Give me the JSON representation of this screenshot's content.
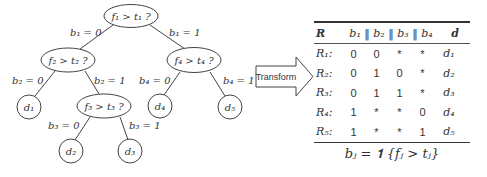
{
  "tree": {
    "nodes": {
      "root": {
        "label": "f₁ > t₁ ?"
      },
      "f2": {
        "label": "f₂ > t₂ ?"
      },
      "f3": {
        "label": "f₃ > t₃ ?"
      },
      "f4": {
        "label": "f₄ > t₄ ?"
      },
      "d1": {
        "label": "d₁"
      },
      "d2": {
        "label": "d₂"
      },
      "d3": {
        "label": "d₃"
      },
      "d4": {
        "label": "d₄"
      },
      "d5": {
        "label": "d₅"
      }
    },
    "edges": {
      "root_f2": "b₁ = 0",
      "root_f4": "b₁ = 1",
      "f2_d1": "b₂ = 0",
      "f2_f3": "b₂ = 1",
      "f3_d2": "b₃ = 0",
      "f3_d3": "b₃ = 1",
      "f4_d4": "b₄ = 0",
      "f4_d5": "b₄ = 1"
    }
  },
  "arrow": {
    "label": "Transform"
  },
  "table": {
    "headers": {
      "rule": "R",
      "bits": "b₁ ‖ b₂ ‖ b₃ ‖ b₄",
      "leaf": "d"
    },
    "rows": [
      {
        "rule": "R₁:",
        "b1": "0",
        "b2": "0",
        "b3": "*",
        "b4": "*",
        "d": "d₁"
      },
      {
        "rule": "R₂:",
        "b1": "0",
        "b2": "1",
        "b3": "0",
        "b4": "*",
        "d": "d₂"
      },
      {
        "rule": "R₃:",
        "b1": "0",
        "b2": "1",
        "b3": "1",
        "b4": "*",
        "d": "d₃"
      },
      {
        "rule": "R₄:",
        "b1": "1",
        "b2": "*",
        "b3": "*",
        "b4": "0",
        "d": "d₄"
      },
      {
        "rule": "R₅:",
        "b1": "1",
        "b2": "*",
        "b3": "*",
        "b4": "1",
        "d": "d₅"
      }
    ]
  },
  "formula": {
    "text": "bⱼ = 𝟏 {fⱼ > tⱼ}"
  }
}
